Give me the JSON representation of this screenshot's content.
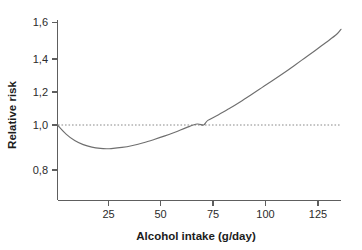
{
  "chart_data": {
    "type": "line",
    "title": "",
    "xlabel": "Alcohol intake (g/day)",
    "ylabel": "Relative risk",
    "xlim": [
      0,
      132
    ],
    "ylim": [
      0.72,
      1.62
    ],
    "grid": false,
    "legend": "none",
    "xticks": [
      25,
      50,
      75,
      100,
      125
    ],
    "xtick_labels": [
      "25",
      "50",
      "75",
      "100",
      "125"
    ],
    "yticks": [
      0.8,
      1.0,
      1.2,
      1.4,
      1.6
    ],
    "ytick_labels": [
      "0,8",
      "1,0",
      "1,2",
      "1,4",
      "1,6"
    ],
    "decimal_separator": ",",
    "annotations": [
      {
        "name": "reference-line",
        "kind": "horizontal-dashed-line",
        "y": 1.0,
        "label": "Relative risk = 1,0"
      }
    ],
    "series": [
      {
        "name": "Relative risk of disease by alcohol intake",
        "style": "solid",
        "color": "#6f6f6f",
        "x": [
          0,
          4,
          8,
          12,
          16,
          20,
          23,
          25,
          30,
          35,
          40,
          45,
          50,
          55,
          60,
          65,
          68,
          70,
          75,
          80,
          85,
          90,
          95,
          100,
          105,
          110,
          115,
          120,
          125,
          130,
          132
        ],
        "y": [
          1.0,
          0.945,
          0.906,
          0.881,
          0.866,
          0.858,
          0.856,
          0.857,
          0.864,
          0.876,
          0.892,
          0.912,
          0.934,
          0.958,
          0.984,
          1.006,
          1.0,
          1.028,
          1.062,
          1.1,
          1.14,
          1.182,
          1.225,
          1.268,
          1.312,
          1.358,
          1.405,
          1.452,
          1.5,
          1.55,
          1.58
        ]
      }
    ],
    "key_points": {
      "start": {
        "x": 0,
        "y": 1.0
      },
      "minimum": {
        "x": 23,
        "y": 0.86
      },
      "crossing_above_one": {
        "x": 68,
        "y": 1.0
      },
      "end": {
        "x": 132,
        "y": 1.58
      }
    },
    "colors": {
      "curve": "#6f6f6f",
      "axis": "#5e5e5e",
      "reference_line": "#8a8a8a",
      "text": "#1c1c1c",
      "background": "#ffffff"
    }
  }
}
